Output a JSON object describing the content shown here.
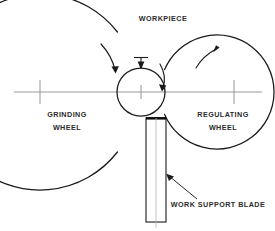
{
  "diagram": {
    "background_color": "#ffffff",
    "line_color": "#1a1a1a",
    "centerline_color": "#9a9a9a",
    "text_color": "#2b2b2b",
    "labels": {
      "workpiece": "WORKPIECE",
      "grinding_wheel_line1": "GRINDING",
      "grinding_wheel_line2": "WHEEL",
      "regulating_wheel_line1": "REGULATING",
      "regulating_wheel_line2": "WHEEL",
      "work_support_blade": "WORK SUPPORT BLADE"
    },
    "parts": {
      "grinding_wheel": {
        "center_x": 40,
        "center_y": 92,
        "radius": 98
      },
      "workpiece": {
        "center_x": 141,
        "center_y": 92,
        "radius": 24
      },
      "regulating_wheel": {
        "center_x": 234,
        "center_y": 92,
        "radius": 57
      },
      "work_support_blade": {
        "x": 146,
        "y": 118,
        "width": 20,
        "height": 104
      }
    },
    "centerline": {
      "y": 92,
      "x_start": 14,
      "x_end": 262
    }
  }
}
